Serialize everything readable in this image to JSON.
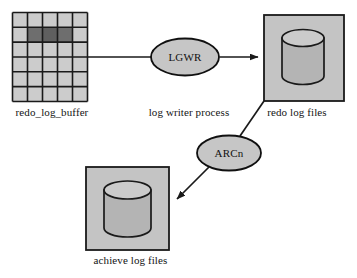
{
  "diagram": {
    "background_color": "#ffffff",
    "line_color": "#1a1a1a",
    "fill_gray": "#bcbcbc",
    "fill_gray_light": "#c9c9c9",
    "fill_gray_dark": "#6e6e6e",
    "nodes": {
      "redo_log_buffer": {
        "label": "redo_log_buffer",
        "type": "grid",
        "columns": 5,
        "rows": 6,
        "highlighted_cells": [
          {
            "row": 2,
            "col": 2
          },
          {
            "row": 2,
            "col": 3
          },
          {
            "row": 2,
            "col": 4
          }
        ]
      },
      "lgwr": {
        "label": "LGWR",
        "caption": "log writer process",
        "type": "ellipse"
      },
      "arcn": {
        "label": "ARCn",
        "type": "ellipse"
      },
      "redo_log_files": {
        "label": "redo log files",
        "type": "box-with-cylinder"
      },
      "achieve_log_files": {
        "label": "achieve log files",
        "type": "box-with-cylinder"
      }
    },
    "connections": [
      {
        "from": "redo_log_buffer",
        "to": "lgwr",
        "arrow": false
      },
      {
        "from": "lgwr",
        "to": "redo_log_files",
        "arrow": true
      },
      {
        "from": "redo_log_files",
        "to": "arcn",
        "arrow": false
      },
      {
        "from": "arcn",
        "to": "achieve_log_files",
        "arrow": true
      }
    ]
  }
}
